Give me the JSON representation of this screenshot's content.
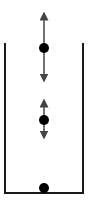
{
  "diagram": {
    "type": "container-with-particles",
    "colors": {
      "line": "#1a1a1a",
      "arrow": "#444444",
      "dot": "#000000",
      "background": "#ffffff"
    },
    "container": {
      "left_x": 5,
      "right_x": 83,
      "top_y": 43,
      "bottom_y": 193,
      "open_top": true
    },
    "particles": [
      {
        "name": "top",
        "cx": 44,
        "cy": 48,
        "r": 5,
        "arrow": {
          "y1": 14,
          "y2": 80
        }
      },
      {
        "name": "middle",
        "cx": 44,
        "cy": 120,
        "r": 5,
        "arrow": {
          "y1": 101,
          "y2": 137
        }
      },
      {
        "name": "bottom",
        "cx": 44,
        "cy": 188,
        "r": 5,
        "arrow": null
      }
    ]
  }
}
